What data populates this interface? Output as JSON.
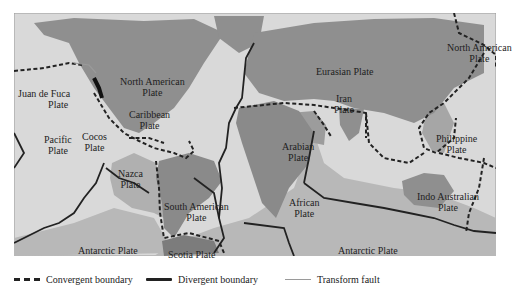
{
  "map": {
    "colors": {
      "ocean": "#d9d9d9",
      "land": "#8f8f8f",
      "plate_fill": "#b4b4b4",
      "boundary": "#222222",
      "frame": "#9a9a9a"
    },
    "plates": [
      {
        "id": "juan-de-fuca",
        "line1": "Juan de Fuca",
        "line2": "Plate"
      },
      {
        "id": "north-american-west",
        "line1": "North American",
        "line2": "Plate"
      },
      {
        "id": "caribbean",
        "line1": "Caribbean",
        "line2": "Plate"
      },
      {
        "id": "pacific",
        "line1": "Pacific",
        "line2": "Plate"
      },
      {
        "id": "cocos",
        "line1": "Cocos",
        "line2": "Plate"
      },
      {
        "id": "nazca",
        "line1": "Nazca",
        "line2": "Plate"
      },
      {
        "id": "south-american",
        "line1": "South American",
        "line2": "Plate"
      },
      {
        "id": "antarctic-west",
        "line1": "Antarctic Plate",
        "line2": ""
      },
      {
        "id": "scotia",
        "line1": "Scotia Plate",
        "line2": ""
      },
      {
        "id": "eurasian",
        "line1": "Eurasian Plate",
        "line2": ""
      },
      {
        "id": "iran",
        "line1": "Iran",
        "line2": "Plate"
      },
      {
        "id": "arabian",
        "line1": "Arabian",
        "line2": "Plate"
      },
      {
        "id": "african",
        "line1": "African",
        "line2": "Plate"
      },
      {
        "id": "north-american-east",
        "line1": "North American",
        "line2": "Plate"
      },
      {
        "id": "philippine",
        "line1": "Philippine",
        "line2": "Plate"
      },
      {
        "id": "indo-australian",
        "line1": "Indo Australian",
        "line2": "Plate"
      },
      {
        "id": "antarctic-east",
        "line1": "Antarctic Plate",
        "line2": ""
      }
    ]
  },
  "legend": {
    "items": [
      {
        "id": "convergent",
        "label": "Convergent boundary",
        "style": "dashed"
      },
      {
        "id": "divergent",
        "label": "Divergent boundary",
        "style": "solid-thick"
      },
      {
        "id": "transform",
        "label": "Transform fault",
        "style": "solid-thin"
      }
    ]
  }
}
